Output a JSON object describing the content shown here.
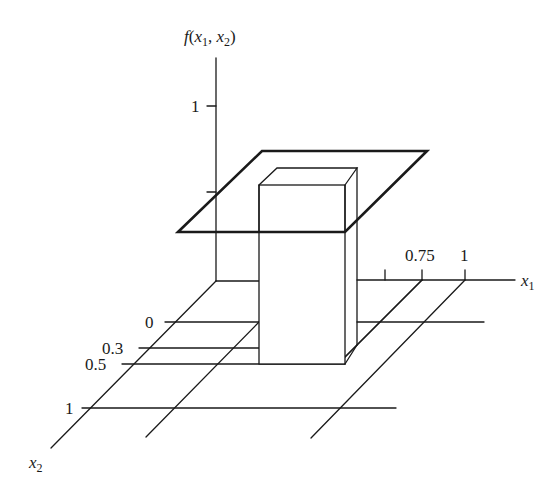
{
  "figure": {
    "type": "3d-box-function-plot",
    "z_axis_label": {
      "f": "f",
      "open": "(",
      "x": "x",
      "sub1": "1",
      "comma": ", ",
      "x2": "x",
      "sub2": "2",
      "close": ")"
    },
    "x1_axis_label": {
      "x": "x",
      "sub": "1"
    },
    "x2_axis_label": {
      "x": "x",
      "sub": "2"
    },
    "z_ticks": [
      {
        "label": "1",
        "value": 1
      }
    ],
    "x1_ticks": [
      {
        "label": "0.75",
        "value": 0.75
      },
      {
        "label": "1",
        "value": 1
      }
    ],
    "x2_ticks": [
      {
        "label": "0",
        "value": 0
      },
      {
        "label": "0.3",
        "value": 0.3
      },
      {
        "label": "0.5",
        "value": 0.5
      },
      {
        "label": "1",
        "value": 1
      }
    ],
    "elements": [
      {
        "name": "unit-plane",
        "description": "thick parallelogram at height ~0.5 over unit square"
      },
      {
        "name": "box",
        "description": "rectangular prism over x2 in [0,0.3..0.5]"
      }
    ],
    "colors": {
      "ink": "#1a1a1a",
      "background": "#ffffff"
    }
  }
}
